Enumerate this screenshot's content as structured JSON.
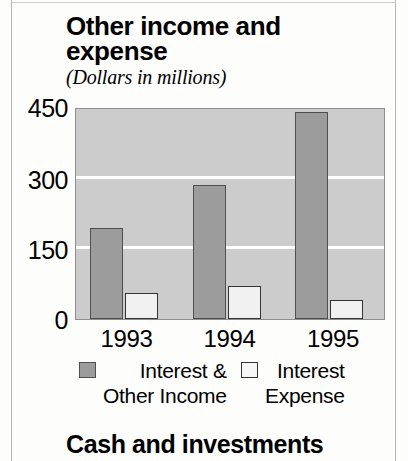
{
  "figure": {
    "title": "Other income and expense",
    "subtitle": "(Dollars in millions)"
  },
  "next_section": {
    "heading": "Cash and investments"
  },
  "legend": {
    "series1_line1": "Interest &",
    "series1_line2": "Other Income",
    "series2_line1": "Interest",
    "series2_line2": "Expense",
    "series1_color": "#9c9c9c",
    "series2_color": "#f1f1f1"
  },
  "axis": {
    "yticks": [
      "450",
      "300",
      "150",
      "0"
    ],
    "xticks": [
      "1993",
      "1994",
      "1995"
    ]
  },
  "chart_data": {
    "type": "bar",
    "title": "Other income and expense",
    "subtitle": "(Dollars in millions)",
    "xlabel": "",
    "ylabel": "",
    "ylim": [
      0,
      450
    ],
    "yticks": [
      0,
      150,
      300,
      450
    ],
    "grid": true,
    "gridline_values": [
      150,
      300
    ],
    "legend_position": "bottom",
    "categories": [
      "1993",
      "1994",
      "1995"
    ],
    "series": [
      {
        "name": "Interest & Other Income",
        "color": "#9c9c9c",
        "values": [
          195,
          288,
          443
        ]
      },
      {
        "name": "Interest Expense",
        "color": "#f1f1f1",
        "values": [
          55,
          70,
          40
        ]
      }
    ]
  }
}
